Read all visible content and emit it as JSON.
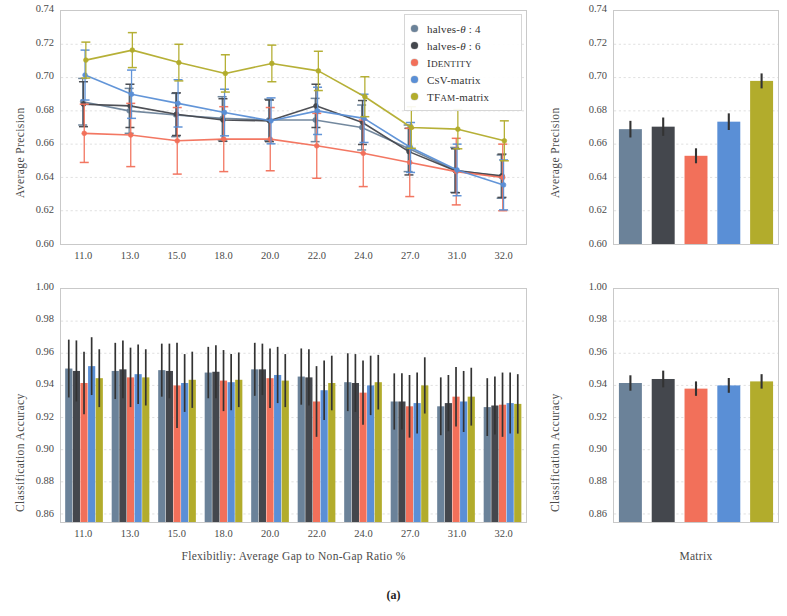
{
  "figure": {
    "caption": "(a)"
  },
  "colors": {
    "halves4": "#6b8299",
    "halves6": "#44474d",
    "identity": "#f2705a",
    "csv": "#5a8fd6",
    "tfam": "#b2ac2c",
    "error": "#333333",
    "grid": "#d8d8d8",
    "axis": "#b9b9b9",
    "text": "#4a4a4a"
  },
  "legend": {
    "items": [
      {
        "label": "halves-θ : 4",
        "color_key": "halves4"
      },
      {
        "label": "halves-θ : 6",
        "color_key": "halves6"
      },
      {
        "label": "Identity",
        "color_key": "identity"
      },
      {
        "label": "CsV-matrix",
        "color_key": "csv"
      },
      {
        "label": "TFAM-matrix",
        "color_key": "tfam"
      }
    ]
  },
  "chart_data": [
    {
      "id": "top-left-lines",
      "type": "line",
      "title": "",
      "xlabel": "",
      "ylabel": "Average Precision",
      "categories": [
        "11.0",
        "13.0",
        "15.0",
        "18.0",
        "20.0",
        "22.0",
        "24.0",
        "27.0",
        "31.0",
        "32.0"
      ],
      "xticklabels": [
        "11.0",
        "13.0",
        "15.0",
        "18.0",
        "20.0",
        "22.0",
        "24.0",
        "27.0",
        "31.0",
        "32.0"
      ],
      "yticklabels": [
        "0.74",
        "0.72",
        "0.70",
        "0.68",
        "0.66",
        "0.64",
        "0.62",
        "0.60"
      ],
      "ylim": [
        0.6,
        0.74
      ],
      "ytick_values": [
        0.74,
        0.72,
        0.7,
        0.68,
        0.66,
        0.64,
        0.62,
        0.6
      ],
      "grid": true,
      "legend_position": "upper right",
      "series": [
        {
          "name": "halves-θ : 4",
          "color_key": "halves4",
          "values": [
            0.6855,
            0.68,
            0.6775,
            0.6755,
            0.6745,
            0.6745,
            0.67,
            0.6575,
            0.6445,
            0.6405
          ],
          "err": [
            0.014,
            0.0135,
            0.013,
            0.013,
            0.0125,
            0.013,
            0.0135,
            0.014,
            0.0135,
            0.013
          ]
        },
        {
          "name": "halves-θ : 6",
          "color_key": "halves6",
          "values": [
            0.684,
            0.683,
            0.678,
            0.6745,
            0.674,
            0.683,
            0.673,
            0.6555,
            0.644,
            0.641
          ],
          "err": [
            0.0135,
            0.013,
            0.0128,
            0.0128,
            0.0125,
            0.013,
            0.0132,
            0.014,
            0.0132,
            0.013
          ]
        },
        {
          "name": "Identity",
          "color_key": "identity",
          "values": [
            0.6665,
            0.6655,
            0.662,
            0.663,
            0.663,
            0.659,
            0.6545,
            0.649,
            0.6435,
            0.64
          ],
          "err": [
            0.0175,
            0.019,
            0.02,
            0.0195,
            0.019,
            0.0195,
            0.02,
            0.0205,
            0.02,
            0.02
          ]
        },
        {
          "name": "CsV-matrix",
          "color_key": "csv",
          "values": [
            0.7015,
            0.69,
            0.6845,
            0.679,
            0.674,
            0.68,
            0.6755,
            0.658,
            0.6445,
            0.6355
          ],
          "err": [
            0.015,
            0.0145,
            0.0142,
            0.014,
            0.0138,
            0.0142,
            0.0145,
            0.015,
            0.0155,
            0.015
          ]
        },
        {
          "name": "TFAM-matrix",
          "color_key": "tfam",
          "values": [
            0.7105,
            0.7165,
            0.709,
            0.7025,
            0.7085,
            0.704,
            0.6885,
            0.67,
            0.669,
            0.662
          ],
          "err": [
            0.0108,
            0.0105,
            0.011,
            0.0112,
            0.011,
            0.0118,
            0.012,
            0.0125,
            0.0118,
            0.012
          ]
        }
      ]
    },
    {
      "id": "top-right-bars",
      "type": "bar",
      "title": "",
      "xlabel": "",
      "ylabel": "Average Precision",
      "categories": [
        "halves-θ : 4",
        "halves-θ : 6",
        "Identity",
        "CsV-matrix",
        "TFAM-matrix"
      ],
      "yticklabels": [
        "0.74",
        "0.72",
        "0.70",
        "0.68",
        "0.66",
        "0.64",
        "0.62",
        "0.60"
      ],
      "ytick_values": [
        0.74,
        0.72,
        0.7,
        0.68,
        0.66,
        0.64,
        0.62,
        0.6
      ],
      "ylim": [
        0.6,
        0.74
      ],
      "grid": true,
      "values": [
        0.669,
        0.6705,
        0.653,
        0.6735,
        0.698
      ],
      "err": [
        0.005,
        0.0055,
        0.0045,
        0.005,
        0.0045
      ],
      "color_keys": [
        "halves4",
        "halves6",
        "identity",
        "csv",
        "tfam"
      ]
    },
    {
      "id": "bottom-left-bars",
      "type": "bar",
      "title": "",
      "xlabel": "Flexibitliy: Average Gap to Non-Gap Ratio %",
      "ylabel": "Classification Accuracy",
      "categories": [
        "11.0",
        "13.0",
        "15.0",
        "18.0",
        "20.0",
        "22.0",
        "24.0",
        "27.0",
        "31.0",
        "32.0"
      ],
      "xticklabels": [
        "11.0",
        "13.0",
        "15.0",
        "18.0",
        "20.0",
        "22.0",
        "24.0",
        "27.0",
        "31.0",
        "32.0"
      ],
      "yticklabels": [
        "1.00",
        "0.98",
        "0.96",
        "0.94",
        "0.92",
        "0.90",
        "0.88",
        "0.86"
      ],
      "ytick_values": [
        1.0,
        0.98,
        0.96,
        0.94,
        0.92,
        0.9,
        0.88,
        0.86
      ],
      "ylim": [
        0.855,
        1.0
      ],
      "grid": true,
      "series": [
        {
          "name": "halves-θ : 4",
          "color_key": "halves4",
          "values": [
            0.9505,
            0.949,
            0.9495,
            0.948,
            0.95,
            0.9455,
            0.942,
            0.93,
            0.927,
            0.9265
          ],
          "err": [
            0.018,
            0.0175,
            0.0165,
            0.016,
            0.0165,
            0.0175,
            0.018,
            0.0175,
            0.018,
            0.018
          ]
        },
        {
          "name": "halves-θ : 6",
          "color_key": "halves6",
          "values": [
            0.949,
            0.95,
            0.949,
            0.9485,
            0.95,
            0.945,
            0.9415,
            0.93,
            0.929,
            0.9275
          ],
          "err": [
            0.019,
            0.018,
            0.017,
            0.0165,
            0.016,
            0.0175,
            0.018,
            0.0175,
            0.0175,
            0.018
          ]
        },
        {
          "name": "Identity",
          "color_key": "identity",
          "values": [
            0.9415,
            0.945,
            0.94,
            0.943,
            0.9445,
            0.93,
            0.9355,
            0.927,
            0.933,
            0.928
          ],
          "err": [
            0.0195,
            0.0185,
            0.0265,
            0.019,
            0.0185,
            0.022,
            0.02,
            0.0195,
            0.0185,
            0.02
          ]
        },
        {
          "name": "CsV-matrix",
          "color_key": "csv",
          "values": [
            0.952,
            0.947,
            0.9415,
            0.942,
            0.9465,
            0.937,
            0.94,
            0.929,
            0.93,
            0.929
          ],
          "err": [
            0.018,
            0.0185,
            0.018,
            0.0175,
            0.0175,
            0.0185,
            0.0185,
            0.019,
            0.019,
            0.019
          ]
        },
        {
          "name": "TFAM-matrix",
          "color_key": "tfam",
          "values": [
            0.9445,
            0.945,
            0.9435,
            0.9435,
            0.943,
            0.9415,
            0.942,
            0.94,
            0.933,
            0.9285
          ],
          "err": [
            0.018,
            0.0175,
            0.0175,
            0.017,
            0.0165,
            0.017,
            0.017,
            0.0175,
            0.018,
            0.0185
          ]
        }
      ]
    },
    {
      "id": "bottom-right-bars",
      "type": "bar",
      "title": "",
      "xlabel": "Matrix",
      "ylabel": "Classification Accuracy",
      "categories": [
        "halves-θ : 4",
        "halves-θ : 6",
        "Identity",
        "CsV-matrix",
        "TFAM-matrix"
      ],
      "yticklabels": [
        "1.00",
        "0.98",
        "0.96",
        "0.94",
        "0.92",
        "0.90",
        "0.88",
        "0.86"
      ],
      "ytick_values": [
        1.0,
        0.98,
        0.96,
        0.94,
        0.92,
        0.9,
        0.88,
        0.86
      ],
      "ylim": [
        0.855,
        1.0
      ],
      "grid": true,
      "values": [
        0.9415,
        0.944,
        0.938,
        0.94,
        0.9425
      ],
      "err": [
        0.0048,
        0.0052,
        0.0045,
        0.0046,
        0.0045
      ],
      "color_keys": [
        "halves4",
        "halves6",
        "identity",
        "csv",
        "tfam"
      ]
    }
  ]
}
